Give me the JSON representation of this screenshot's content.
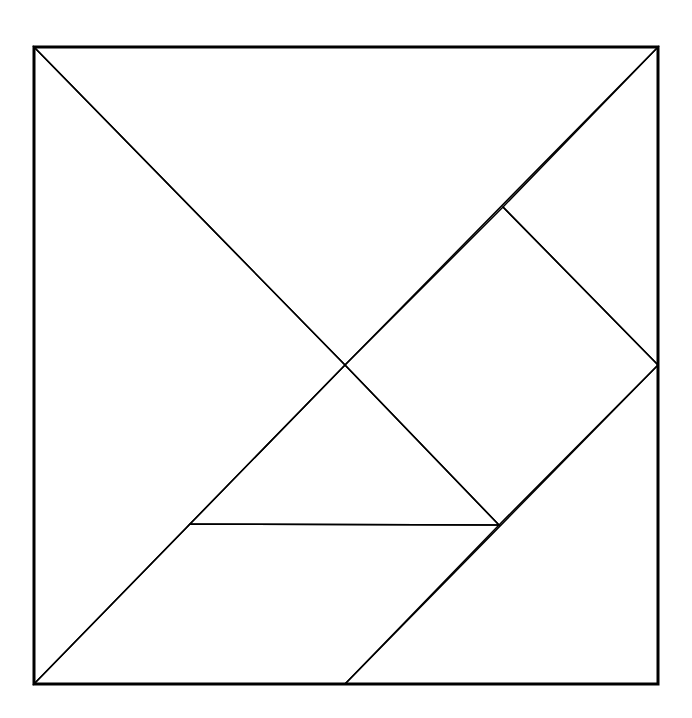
{
  "diagram": {
    "type": "tangram",
    "title": "",
    "stroke_color": "#000000",
    "background": "#ffffff",
    "outer_square": {
      "x1": 34,
      "y1": 47,
      "x2": 658,
      "y2": 684
    },
    "pieces": [
      {
        "name": "large-triangle-top",
        "points": "34,47 658,47 345,365"
      },
      {
        "name": "large-triangle-left",
        "points": "34,47 345,365 34,684"
      },
      {
        "name": "small-triangle-right-top",
        "points": "503,207 658,47 658,365"
      },
      {
        "name": "square",
        "points": "345,365 503,207 658,365 499,525"
      },
      {
        "name": "small-triangle-center",
        "points": "345,365 499,525 190,524"
      },
      {
        "name": "parallelogram",
        "points": "190,524 499,525 345,684 34,684"
      },
      {
        "name": "medium-triangle-bottom-right",
        "points": "658,365 658,684 345,684"
      }
    ]
  }
}
